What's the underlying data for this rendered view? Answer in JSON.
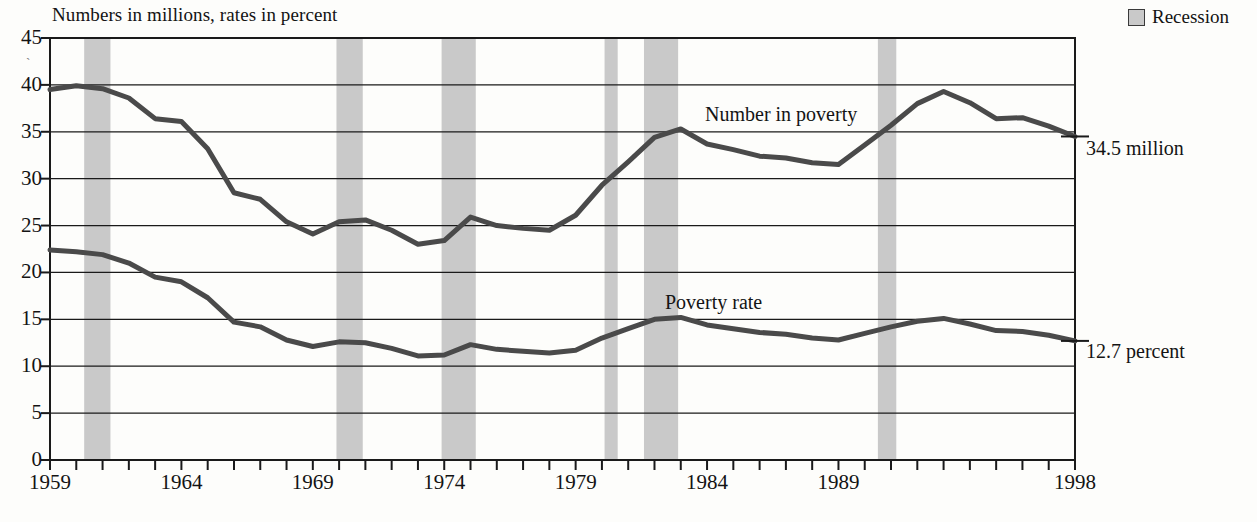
{
  "subtitle": "Numbers in millions, rates in percent",
  "legend": {
    "recession_label": "Recession",
    "swatch_color": "#c9c9c9"
  },
  "annotations": {
    "number_series_label": "Number in poverty",
    "rate_series_label": "Poverty rate",
    "number_end_label": "34.5 million",
    "rate_end_label": "12.7 percent"
  },
  "colors": {
    "line": "#4a4a4a",
    "recession_band": "#c9c9c9",
    "axis": "#1a1a1a",
    "gridline": "#1a1a1a"
  },
  "chart_data": {
    "type": "line",
    "title": "",
    "subtitle": "Numbers in millions, rates in percent",
    "xlabel": "",
    "ylabel": "",
    "xlim": [
      1959,
      1998
    ],
    "ylim": [
      0,
      45
    ],
    "ytick_labels": [
      "0",
      "5",
      "10",
      "15",
      "20",
      "25",
      "30",
      "35",
      "40",
      "45"
    ],
    "yticks": [
      0,
      5,
      10,
      15,
      20,
      25,
      30,
      35,
      40,
      45
    ],
    "xtick_labels": [
      "1959",
      "1964",
      "1969",
      "1974",
      "1979",
      "1984",
      "1989",
      "1998"
    ],
    "xticks": [
      1959,
      1964,
      1969,
      1974,
      1979,
      1984,
      1989,
      1998
    ],
    "minor_xticks_every": 1,
    "grid": "horizontal",
    "legend_position": "top-right",
    "x": [
      1959,
      1960,
      1961,
      1962,
      1963,
      1964,
      1965,
      1966,
      1967,
      1968,
      1969,
      1970,
      1971,
      1972,
      1973,
      1974,
      1975,
      1976,
      1977,
      1978,
      1979,
      1980,
      1981,
      1982,
      1983,
      1984,
      1985,
      1986,
      1987,
      1988,
      1989,
      1990,
      1991,
      1992,
      1993,
      1994,
      1995,
      1996,
      1997,
      1998
    ],
    "series": [
      {
        "name": "Number in poverty",
        "units": "millions",
        "end_value": 34.5,
        "values": [
          39.5,
          39.9,
          39.6,
          38.6,
          36.4,
          36.1,
          33.2,
          28.5,
          27.8,
          25.4,
          24.1,
          25.4,
          25.6,
          24.5,
          23.0,
          23.4,
          25.9,
          25.0,
          24.7,
          24.5,
          26.1,
          29.3,
          31.8,
          34.4,
          35.3,
          33.7,
          33.1,
          32.4,
          32.2,
          31.7,
          31.5,
          33.6,
          35.7,
          38.0,
          39.3,
          38.1,
          36.4,
          36.5,
          35.6,
          34.5
        ]
      },
      {
        "name": "Poverty rate",
        "units": "percent",
        "end_value": 12.7,
        "values": [
          22.4,
          22.2,
          21.9,
          21.0,
          19.5,
          19.0,
          17.3,
          14.7,
          14.2,
          12.8,
          12.1,
          12.6,
          12.5,
          11.9,
          11.1,
          11.2,
          12.3,
          11.8,
          11.6,
          11.4,
          11.7,
          13.0,
          14.0,
          15.0,
          15.2,
          14.4,
          14.0,
          13.6,
          13.4,
          13.0,
          12.8,
          13.5,
          14.2,
          14.8,
          15.1,
          14.5,
          13.8,
          13.7,
          13.3,
          12.7
        ]
      }
    ],
    "recessions": [
      {
        "start": 1960.3,
        "end": 1961.3
      },
      {
        "start": 1969.9,
        "end": 1970.9
      },
      {
        "start": 1973.9,
        "end": 1975.2
      },
      {
        "start": 1980.1,
        "end": 1980.6
      },
      {
        "start": 1981.6,
        "end": 1982.9
      },
      {
        "start": 1990.5,
        "end": 1991.2
      }
    ]
  }
}
